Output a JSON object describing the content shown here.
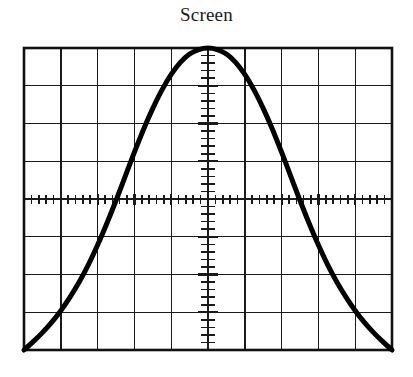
{
  "figure": {
    "title": "Screen",
    "kind": "oscilloscope-screen"
  },
  "colors": {
    "background": "#ffffff",
    "graticule": "#1a1a1a",
    "border": "#111111",
    "trace": "#000000",
    "title_text": "#1a1a1a"
  },
  "graticule": {
    "left": 24,
    "top": 48,
    "right": 392,
    "bottom": 350,
    "columns": 10,
    "rows": 8,
    "minor_ticks_per_division": 5,
    "border_width": 2.6,
    "grid_line_width": 1.4,
    "axis_line_width": 2.2,
    "tick_line_width": 1.6,
    "h_axis_row_index": 4,
    "v_axis_col_index": 5,
    "h_tick_length": 9,
    "v_tick_length": 11
  },
  "chart_data": {
    "type": "line",
    "title": "Screen",
    "xlabel": "",
    "ylabel": "",
    "xlim": [
      -5,
      5
    ],
    "ylim": [
      -4,
      4
    ],
    "grid": true,
    "legend": null,
    "annotations": [],
    "x_tick_labels": [],
    "y_tick_labels": [],
    "series": [
      {
        "name": "trace",
        "line_width": 5.0,
        "color": "#000000",
        "x": [
          -5.0,
          -4.75,
          -4.5,
          -4.25,
          -4.0,
          -3.75,
          -3.5,
          -3.25,
          -3.0,
          -2.75,
          -2.5,
          -2.25,
          -2.0,
          -1.75,
          -1.5,
          -1.25,
          -1.0,
          -0.75,
          -0.5,
          -0.25,
          0.0,
          0.25,
          0.5,
          0.75,
          1.0,
          1.25,
          1.5,
          1.75,
          2.0,
          2.25,
          2.5,
          2.75,
          3.0,
          3.25,
          3.5,
          3.75,
          4.0,
          4.25,
          4.5,
          4.75,
          5.0
        ],
        "y": [
          -4.0,
          -3.78,
          -3.54,
          -3.27,
          -2.96,
          -2.6,
          -2.2,
          -1.74,
          -1.22,
          -0.65,
          -0.04,
          0.6,
          1.24,
          1.85,
          2.4,
          2.89,
          3.3,
          3.62,
          3.84,
          3.96,
          4.0,
          3.96,
          3.84,
          3.62,
          3.3,
          2.89,
          2.4,
          1.85,
          1.24,
          0.6,
          -0.04,
          -0.65,
          -1.22,
          -1.74,
          -2.2,
          -2.6,
          -2.96,
          -3.27,
          -3.54,
          -3.78,
          -4.0
        ]
      }
    ]
  }
}
